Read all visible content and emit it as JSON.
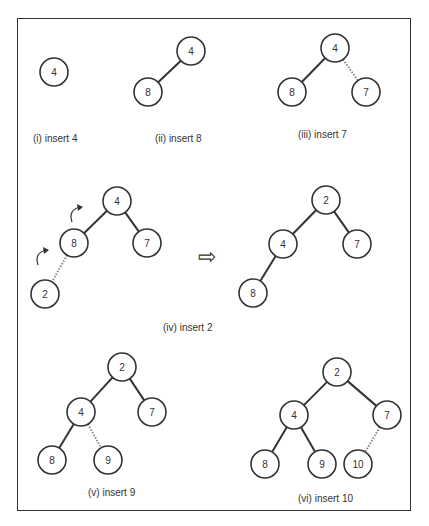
{
  "diagram": {
    "title_cutoff": "",
    "arrow_symbol": "⇨",
    "panels": [
      {
        "id": "i",
        "caption": "(i) insert 4",
        "caption_pos": [
          33,
          142
        ],
        "nodes": [
          {
            "label": "4",
            "x": 54,
            "y": 72
          }
        ],
        "edges": []
      },
      {
        "id": "ii",
        "caption": "(ii) insert 8",
        "caption_pos": [
          155,
          142
        ],
        "nodes": [
          {
            "label": "4",
            "x": 191,
            "y": 51
          },
          {
            "label": "8",
            "x": 148,
            "y": 92
          }
        ],
        "edges": [
          {
            "from": 0,
            "to": 1,
            "style": "solid"
          }
        ]
      },
      {
        "id": "iii",
        "caption": "(iii) insert 7",
        "caption_pos": [
          298,
          138
        ],
        "nodes": [
          {
            "label": "4",
            "x": 335,
            "y": 48
          },
          {
            "label": "8",
            "x": 292,
            "y": 92
          },
          {
            "label": "7",
            "x": 366,
            "y": 92
          }
        ],
        "edges": [
          {
            "from": 0,
            "to": 1,
            "style": "solid"
          },
          {
            "from": 0,
            "to": 2,
            "style": "dashed"
          }
        ]
      },
      {
        "id": "iv-before",
        "caption": "(iv) insert 2",
        "caption_pos": [
          163,
          331
        ],
        "nodes": [
          {
            "label": "4",
            "x": 117,
            "y": 201
          },
          {
            "label": "8",
            "x": 74,
            "y": 243
          },
          {
            "label": "7",
            "x": 147,
            "y": 243
          },
          {
            "label": "2",
            "x": 45,
            "y": 294
          }
        ],
        "edges": [
          {
            "from": 0,
            "to": 1,
            "style": "solid"
          },
          {
            "from": 0,
            "to": 2,
            "style": "solid"
          },
          {
            "from": 1,
            "to": 3,
            "style": "dashed"
          }
        ],
        "rotation_arrows": [
          {
            "x": 78,
            "y": 210
          },
          {
            "x": 44,
            "y": 253
          }
        ]
      },
      {
        "id": "iv-after",
        "caption": "",
        "nodes": [
          {
            "label": "2",
            "x": 326,
            "y": 200
          },
          {
            "label": "4",
            "x": 283,
            "y": 244
          },
          {
            "label": "7",
            "x": 357,
            "y": 244
          },
          {
            "label": "8",
            "x": 253,
            "y": 293
          }
        ],
        "edges": [
          {
            "from": 0,
            "to": 1,
            "style": "solid"
          },
          {
            "from": 0,
            "to": 2,
            "style": "solid"
          },
          {
            "from": 1,
            "to": 3,
            "style": "solid"
          }
        ]
      },
      {
        "id": "v",
        "caption": "(v) insert 9",
        "caption_pos": [
          88,
          496
        ],
        "nodes": [
          {
            "label": "2",
            "x": 122,
            "y": 367
          },
          {
            "label": "4",
            "x": 81,
            "y": 412
          },
          {
            "label": "7",
            "x": 152,
            "y": 412
          },
          {
            "label": "8",
            "x": 52,
            "y": 460
          },
          {
            "label": "9",
            "x": 108,
            "y": 460
          }
        ],
        "edges": [
          {
            "from": 0,
            "to": 1,
            "style": "solid"
          },
          {
            "from": 0,
            "to": 2,
            "style": "solid"
          },
          {
            "from": 1,
            "to": 3,
            "style": "solid"
          },
          {
            "from": 1,
            "to": 4,
            "style": "dashed"
          }
        ]
      },
      {
        "id": "vi",
        "caption": "(vi) insert 10",
        "caption_pos": [
          298,
          502
        ],
        "nodes": [
          {
            "label": "2",
            "x": 337,
            "y": 372
          },
          {
            "label": "4",
            "x": 294,
            "y": 415
          },
          {
            "label": "7",
            "x": 387,
            "y": 415
          },
          {
            "label": "8",
            "x": 265,
            "y": 464
          },
          {
            "label": "9",
            "x": 322,
            "y": 464
          },
          {
            "label": "10",
            "x": 358,
            "y": 464
          }
        ],
        "edges": [
          {
            "from": 0,
            "to": 1,
            "style": "solid"
          },
          {
            "from": 0,
            "to": 2,
            "style": "solid"
          },
          {
            "from": 1,
            "to": 3,
            "style": "solid"
          },
          {
            "from": 1,
            "to": 4,
            "style": "solid"
          },
          {
            "from": 2,
            "to": 5,
            "style": "dashed"
          }
        ]
      }
    ]
  }
}
